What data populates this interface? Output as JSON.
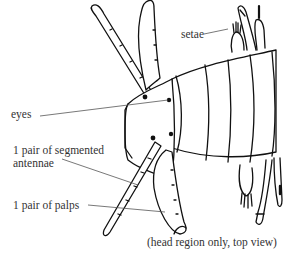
{
  "figure": {
    "caption": "(head region only, top view)",
    "labels": {
      "setae": "setae",
      "eyes": "eyes",
      "antennae_line1": "1 pair of segmented",
      "antennae_line2": "antennae",
      "palps": "1 pair of palps"
    },
    "colors": {
      "stroke": "#111111",
      "label_text": "#333333",
      "leader_line": "#555555",
      "background": "#ffffff"
    }
  }
}
